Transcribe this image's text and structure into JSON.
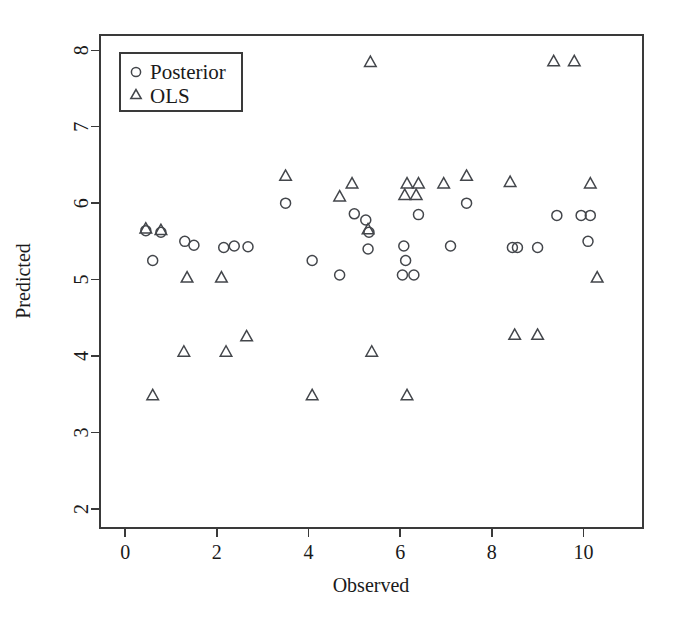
{
  "chart_data": {
    "type": "scatter",
    "title": "",
    "xlabel": "Observed",
    "ylabel": "Predicted",
    "xlim": [
      -0.55,
      11.3
    ],
    "ylim": [
      1.75,
      8.2
    ],
    "xticks": [
      0,
      2,
      4,
      6,
      8,
      10
    ],
    "yticks": [
      2,
      3,
      4,
      5,
      6,
      7,
      8
    ],
    "grid": false,
    "legend_position": "top-left",
    "series": [
      {
        "name": "Posterior",
        "marker": "circle",
        "points": [
          [
            0.45,
            5.64
          ],
          [
            0.6,
            5.25
          ],
          [
            0.78,
            5.62
          ],
          [
            1.3,
            5.5
          ],
          [
            1.5,
            5.45
          ],
          [
            2.15,
            5.42
          ],
          [
            2.38,
            5.44
          ],
          [
            2.68,
            5.43
          ],
          [
            3.5,
            6.0
          ],
          [
            4.08,
            5.25
          ],
          [
            4.68,
            5.06
          ],
          [
            5.0,
            5.86
          ],
          [
            5.25,
            5.78
          ],
          [
            5.32,
            5.62
          ],
          [
            5.3,
            5.4
          ],
          [
            6.08,
            5.44
          ],
          [
            6.12,
            5.25
          ],
          [
            6.05,
            5.06
          ],
          [
            6.3,
            5.06
          ],
          [
            6.4,
            5.85
          ],
          [
            7.1,
            5.44
          ],
          [
            7.45,
            6.0
          ],
          [
            8.45,
            5.42
          ],
          [
            8.56,
            5.42
          ],
          [
            9.0,
            5.42
          ],
          [
            9.42,
            5.84
          ],
          [
            9.95,
            5.84
          ],
          [
            10.15,
            5.84
          ],
          [
            10.1,
            5.5
          ]
        ]
      },
      {
        "name": "OLS",
        "marker": "triangle",
        "points": [
          [
            0.45,
            5.66
          ],
          [
            0.78,
            5.64
          ],
          [
            0.6,
            3.48
          ],
          [
            1.28,
            4.05
          ],
          [
            1.35,
            5.02
          ],
          [
            2.1,
            5.02
          ],
          [
            2.2,
            4.05
          ],
          [
            2.65,
            4.25
          ],
          [
            3.5,
            6.35
          ],
          [
            4.08,
            3.48
          ],
          [
            4.68,
            6.08
          ],
          [
            4.95,
            6.25
          ],
          [
            5.3,
            5.65
          ],
          [
            5.35,
            7.84
          ],
          [
            5.38,
            4.05
          ],
          [
            6.1,
            6.1
          ],
          [
            6.15,
            6.25
          ],
          [
            6.35,
            6.1
          ],
          [
            6.4,
            6.25
          ],
          [
            6.15,
            3.48
          ],
          [
            6.95,
            6.25
          ],
          [
            7.45,
            6.35
          ],
          [
            8.4,
            6.27
          ],
          [
            8.5,
            4.27
          ],
          [
            9.0,
            4.27
          ],
          [
            9.35,
            7.85
          ],
          [
            9.8,
            7.85
          ],
          [
            10.15,
            6.25
          ],
          [
            10.3,
            5.02
          ]
        ]
      }
    ]
  },
  "legend": {
    "entries": [
      {
        "label": "Posterior",
        "marker": "circle-icon"
      },
      {
        "label": "OLS",
        "marker": "triangle-icon"
      }
    ]
  },
  "colors": {
    "marker": "#43464b",
    "axis": "#3a3a3a",
    "text": "#1a1a1a",
    "background": "#ffffff"
  }
}
